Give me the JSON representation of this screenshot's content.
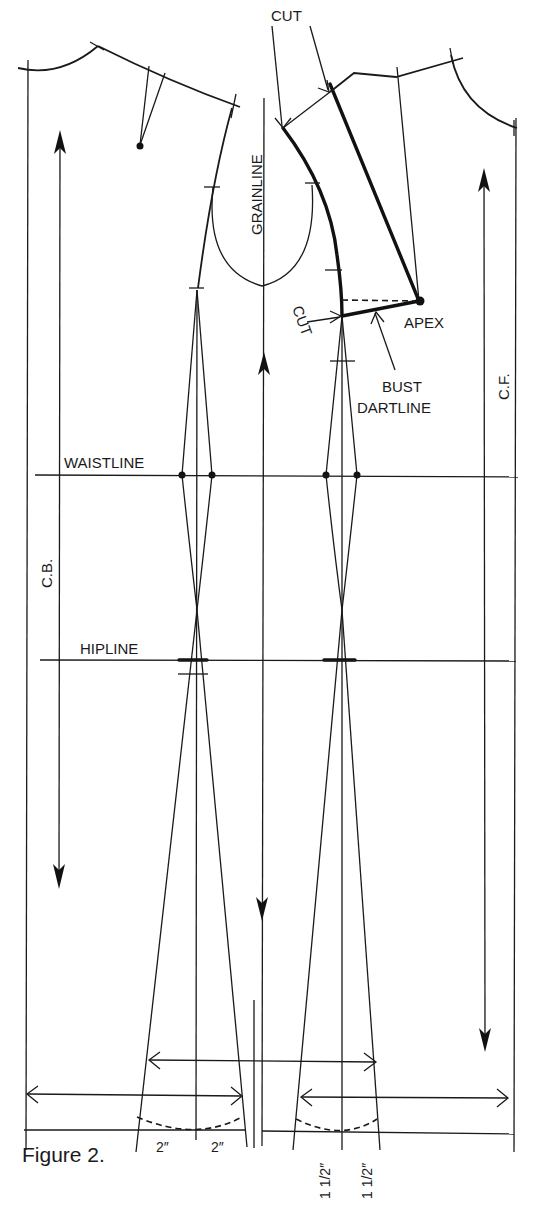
{
  "figure": {
    "caption": "Figure 2.",
    "type": "pattern-draft",
    "colors": {
      "ink": "#1a1a1a",
      "paper": "#ffffff"
    }
  },
  "labels": {
    "cut_top": "CUT",
    "cut_side": "CUT",
    "grainline": "GRAINLINE",
    "apex": "APEX",
    "bust_dartline_1": "BUST",
    "bust_dartline_2": "DARTLINE",
    "center_front": "C.F.",
    "center_back": "C.B.",
    "waistline": "WAISTLINE",
    "hipline": "HIPLINE"
  },
  "measurements": {
    "back_left": "2″",
    "back_right": "2″",
    "front_left": "1 1/2″",
    "front_right": "1 1/2″"
  }
}
